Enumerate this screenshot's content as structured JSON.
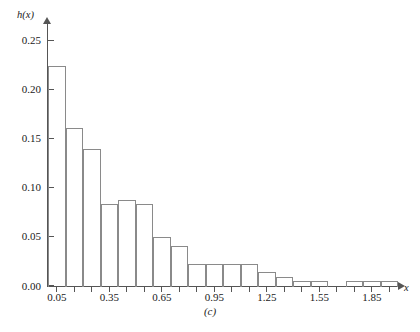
{
  "figure": {
    "caption": "(c)",
    "ylabel": "h(x)",
    "xlabel": "x"
  },
  "axes": {
    "y_tick_labels": [
      "0.00",
      "0.05",
      "0.10",
      "0.15",
      "0.20",
      "0.25"
    ],
    "y_tick_values": [
      0.0,
      0.05,
      0.1,
      0.15,
      0.2,
      0.25
    ],
    "x_tick_labels": [
      "0.05",
      "0.35",
      "0.65",
      "0.95",
      "1.25",
      "1.55",
      "1.85"
    ],
    "x_tick_values": [
      0.05,
      0.35,
      0.65,
      0.95,
      1.25,
      1.55,
      1.85
    ],
    "x_minor_tick_values": [
      0.05,
      0.15,
      0.25,
      0.35,
      0.45,
      0.55,
      0.65,
      0.75,
      0.85,
      0.95,
      1.05,
      1.15,
      1.25,
      1.35,
      1.45,
      1.55,
      1.65,
      1.75,
      1.85,
      1.95
    ],
    "ylim": [
      0.0,
      0.26
    ],
    "xlim": [
      0.0,
      2.0
    ],
    "grid": false,
    "legend": "none"
  },
  "style": {
    "bar_edge_color": "#8a8a8a",
    "bar_fill_color": "#ffffff",
    "axis_color": "#555555",
    "text_color": "#1a1a1a",
    "background_color": "#ffffff"
  },
  "chart_data": {
    "type": "bar",
    "title": "",
    "subtitle": "",
    "xlabel": "x",
    "ylabel": "h(x)",
    "xlim": [
      0.0,
      2.0
    ],
    "ylim": [
      0.0,
      0.26
    ],
    "grid": false,
    "legend_position": "none",
    "bin_width": 0.1,
    "annotations": [
      "(c)"
    ],
    "categories": [
      "0.0-0.1",
      "0.1-0.2",
      "0.2-0.3",
      "0.3-0.4",
      "0.4-0.5",
      "0.5-0.6",
      "0.6-0.7",
      "0.7-0.8",
      "0.8-0.9",
      "0.9-1.0",
      "1.0-1.1",
      "1.1-1.2",
      "1.2-1.3",
      "1.3-1.4",
      "1.4-1.5",
      "1.5-1.6",
      "1.6-1.7",
      "1.7-1.8",
      "1.8-1.9",
      "1.9-2.0"
    ],
    "bin_edges": [
      0.0,
      0.1,
      0.2,
      0.3,
      0.4,
      0.5,
      0.6,
      0.7,
      0.8,
      0.9,
      1.0,
      1.1,
      1.2,
      1.3,
      1.4,
      1.5,
      1.6,
      1.7,
      1.8,
      1.9,
      2.0
    ],
    "values": [
      0.224,
      0.161,
      0.139,
      0.083,
      0.088,
      0.083,
      0.05,
      0.041,
      0.022,
      0.022,
      0.022,
      0.022,
      0.014,
      0.009,
      0.005,
      0.005,
      0.0,
      0.005,
      0.005,
      0.005
    ]
  }
}
